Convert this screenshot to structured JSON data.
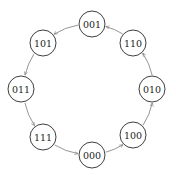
{
  "diagram": {
    "type": "state-cycle",
    "colors": {
      "node_stroke": "#2a2a2a",
      "edge": "#7a7a7a",
      "background": "#ffffff"
    },
    "node_radius": 13,
    "nodes": [
      {
        "id": "001",
        "label": "001",
        "x": 92,
        "y": 24
      },
      {
        "id": "101",
        "label": "101",
        "x": 43,
        "y": 43
      },
      {
        "id": "011",
        "label": "011",
        "x": 21,
        "y": 89
      },
      {
        "id": "111",
        "label": "111",
        "x": 43,
        "y": 137
      },
      {
        "id": "000",
        "label": "000",
        "x": 92,
        "y": 155
      },
      {
        "id": "100",
        "label": "100",
        "x": 133,
        "y": 135
      },
      {
        "id": "010",
        "label": "010",
        "x": 152,
        "y": 89
      },
      {
        "id": "110",
        "label": "110",
        "x": 133,
        "y": 43
      }
    ],
    "edges": [
      {
        "from": "110",
        "to": "001"
      },
      {
        "from": "001",
        "to": "101"
      },
      {
        "from": "101",
        "to": "011"
      },
      {
        "from": "011",
        "to": "111"
      },
      {
        "from": "111",
        "to": "000"
      },
      {
        "from": "000",
        "to": "100"
      },
      {
        "from": "100",
        "to": "010"
      },
      {
        "from": "010",
        "to": "110"
      }
    ]
  }
}
